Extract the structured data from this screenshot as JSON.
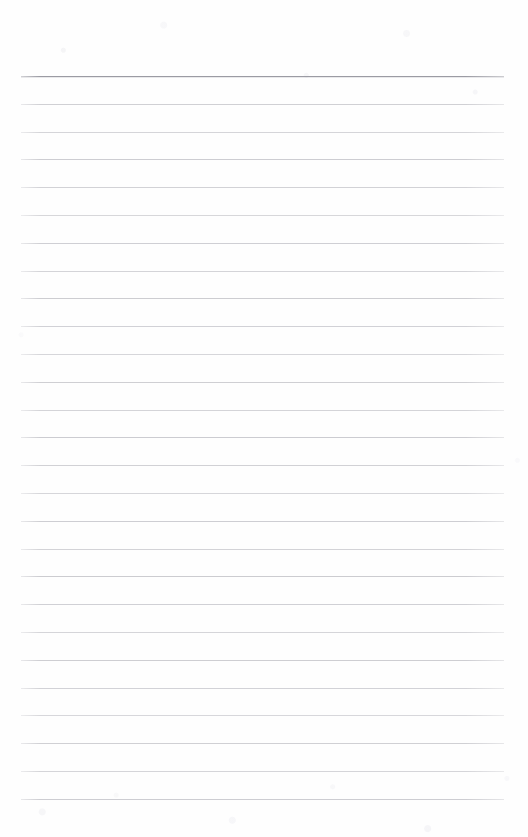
{
  "document": {
    "kind": "scanned-ruled-paper",
    "title": "Blank Lined Notebook Page",
    "page_width": 528,
    "page_height": 837,
    "background_color": "#fefefe",
    "has_text_content": false,
    "text_content": "",
    "handwriting": "",
    "margin_note": "",
    "header_text": "",
    "footer_text": "",
    "page_number": ""
  },
  "ruling": {
    "line_count": 27,
    "line_spacing_px": 27.8,
    "first_line_y": 76,
    "last_line_y": 799,
    "line_left_x": 21,
    "line_right_x": 504,
    "line_color": "#c9c9ce",
    "header_rule_color": "#9b9ba3",
    "header_rule_index": 0,
    "line_thickness_px": 1,
    "has_vertical_margin_rule": false,
    "top_margin_px": 76,
    "bottom_margin_px": 38
  },
  "lines": [
    {
      "index": 0,
      "y": 76,
      "emphasis": "header"
    },
    {
      "index": 1,
      "y": 104,
      "emphasis": "normal"
    },
    {
      "index": 2,
      "y": 132,
      "emphasis": "normal"
    },
    {
      "index": 3,
      "y": 159,
      "emphasis": "normal"
    },
    {
      "index": 4,
      "y": 187,
      "emphasis": "normal"
    },
    {
      "index": 5,
      "y": 215,
      "emphasis": "normal"
    },
    {
      "index": 6,
      "y": 243,
      "emphasis": "normal"
    },
    {
      "index": 7,
      "y": 271,
      "emphasis": "normal"
    },
    {
      "index": 8,
      "y": 298,
      "emphasis": "normal"
    },
    {
      "index": 9,
      "y": 326,
      "emphasis": "normal"
    },
    {
      "index": 10,
      "y": 354,
      "emphasis": "normal"
    },
    {
      "index": 11,
      "y": 382,
      "emphasis": "normal"
    },
    {
      "index": 12,
      "y": 410,
      "emphasis": "normal"
    },
    {
      "index": 13,
      "y": 437,
      "emphasis": "normal"
    },
    {
      "index": 14,
      "y": 465,
      "emphasis": "normal"
    },
    {
      "index": 15,
      "y": 493,
      "emphasis": "normal"
    },
    {
      "index": 16,
      "y": 521,
      "emphasis": "normal"
    },
    {
      "index": 17,
      "y": 549,
      "emphasis": "normal"
    },
    {
      "index": 18,
      "y": 576,
      "emphasis": "normal"
    },
    {
      "index": 19,
      "y": 604,
      "emphasis": "normal"
    },
    {
      "index": 20,
      "y": 632,
      "emphasis": "normal"
    },
    {
      "index": 21,
      "y": 660,
      "emphasis": "normal"
    },
    {
      "index": 22,
      "y": 688,
      "emphasis": "normal"
    },
    {
      "index": 23,
      "y": 715,
      "emphasis": "normal"
    },
    {
      "index": 24,
      "y": 743,
      "emphasis": "normal"
    },
    {
      "index": 25,
      "y": 771,
      "emphasis": "normal"
    },
    {
      "index": 26,
      "y": 799,
      "emphasis": "normal"
    }
  ]
}
